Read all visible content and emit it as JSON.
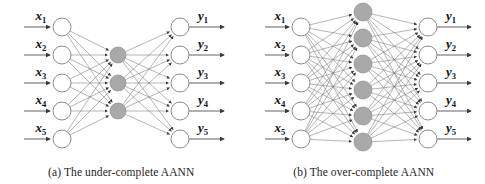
{
  "figure": {
    "background": "#ffffff",
    "width": 485,
    "height": 184
  },
  "style": {
    "io_node_fill": "#ffffff",
    "io_node_stroke": "#6e6e6e",
    "hidden_node_fill": "#a9a9a9",
    "hidden_node_stroke": "#8c8c8c",
    "edge_color": "#777777",
    "arrow_color": "#3a3a3a",
    "label_color": "#111111",
    "caption_color": "#1d1d1d"
  },
  "panels": [
    {
      "id": "panel-a",
      "caption": "(a) The under-complete AANN",
      "layers": {
        "input_count": 5,
        "hidden_count": 3,
        "output_count": 5
      },
      "input_labels": [
        "x1",
        "x2",
        "x3",
        "x4",
        "x5"
      ],
      "output_labels": [
        "y1",
        "y2",
        "y3",
        "y4",
        "y5"
      ],
      "input_label_base": "x",
      "output_label_base": "y",
      "input_subscripts": [
        "1",
        "2",
        "3",
        "4",
        "5"
      ],
      "output_subscripts": [
        "1",
        "2",
        "3",
        "4",
        "5"
      ],
      "geometry": {
        "viewbox_w": 242,
        "viewbox_h": 160,
        "input_x": 62,
        "hidden_x": 118,
        "output_x": 180,
        "input_y_start": 27,
        "input_y_step": 28,
        "output_y_start": 27,
        "output_y_step": 28,
        "hidden_y_start": 55,
        "hidden_y_step": 28,
        "io_radius": 9,
        "hidden_radius": 8,
        "in_arrow_start_x": 24,
        "out_arrow_end_x": 224
      }
    },
    {
      "id": "panel-b",
      "caption": "(b) The over-complete AANN",
      "layers": {
        "input_count": 5,
        "hidden_count": 6,
        "output_count": 5
      },
      "input_labels": [
        "x1",
        "x2",
        "x3",
        "x4",
        "x5"
      ],
      "output_labels": [
        "y1",
        "y2",
        "y3",
        "y4",
        "y5"
      ],
      "input_label_base": "x",
      "output_label_base": "y",
      "input_subscripts": [
        "1",
        "2",
        "3",
        "4",
        "5"
      ],
      "output_subscripts": [
        "1",
        "2",
        "3",
        "4",
        "5"
      ],
      "geometry": {
        "viewbox_w": 242,
        "viewbox_h": 160,
        "input_x": 58,
        "hidden_x": 120,
        "output_x": 185,
        "input_y_start": 27,
        "input_y_step": 28,
        "output_y_start": 27,
        "output_y_step": 28,
        "hidden_y_start": 12,
        "hidden_y_step": 26,
        "io_radius": 9,
        "hidden_radius": 9,
        "in_arrow_start_x": 22,
        "out_arrow_end_x": 228
      }
    }
  ],
  "diagram_data": {
    "type": "diagram",
    "subject": "Auto-associative neural network (AANN) architectures",
    "description": "Two fully-connected three-layer autoencoder topologies with five inputs and five outputs",
    "variants": [
      {
        "name": "under-complete",
        "caption": "(a) The under-complete AANN",
        "input_nodes": 5,
        "hidden_nodes": 3,
        "output_nodes": 5,
        "edges_input_to_hidden": 15,
        "edges_hidden_to_output": 15,
        "note": "hidden layer smaller than input layer"
      },
      {
        "name": "over-complete",
        "caption": "(b) The over-complete AANN",
        "input_nodes": 5,
        "hidden_nodes": 6,
        "output_nodes": 5,
        "edges_input_to_hidden": 30,
        "edges_hidden_to_output": 30,
        "note": "hidden layer larger than input layer"
      }
    ]
  }
}
